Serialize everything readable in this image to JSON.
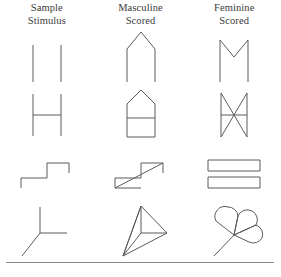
{
  "figure": {
    "columns": [
      {
        "id": "sample-stimulus",
        "line1": "Sample",
        "line2": "Stimulus"
      },
      {
        "id": "masculine-scored",
        "line1": "Masculine",
        "line2": "Scored"
      },
      {
        "id": "feminine-scored",
        "line1": "Feminine",
        "line2": "Scored"
      }
    ],
    "rows": [
      {
        "id": "row-1",
        "stimulus": {
          "name": "two-vertical-lines",
          "label": "two parallel vertical lines"
        },
        "masculine": {
          "name": "peaked-roof",
          "label": "peaked roof with two legs"
        },
        "feminine": {
          "name": "m-shape",
          "label": "M shape with center V notch"
        }
      },
      {
        "id": "row-2",
        "stimulus": {
          "name": "h-shape",
          "label": "H shape"
        },
        "masculine": {
          "name": "house-with-divider",
          "label": "house outline with horizontal divider"
        },
        "feminine": {
          "name": "bowtie-x-frame",
          "label": "X bowtie inside vertical frame with crossbar"
        }
      },
      {
        "id": "row-3",
        "stimulus": {
          "name": "stair-step",
          "label": "stair step line"
        },
        "masculine": {
          "name": "step-with-diagonal",
          "label": "stair step with long diagonal forming triangles"
        },
        "feminine": {
          "name": "two-stacked-rectangles",
          "label": "two stacked horizontal rectangles"
        }
      },
      {
        "id": "row-4",
        "stimulus": {
          "name": "y-junction",
          "label": "three pronged Y junction"
        },
        "masculine": {
          "name": "tetrahedron",
          "label": "three dimensional tetrahedron"
        },
        "feminine": {
          "name": "flower-with-stem",
          "label": "three petal flower with stem"
        }
      }
    ],
    "colors": {
      "ink": "#5b5b5b",
      "text": "#3a3a3a",
      "rule": "#8a8a8a",
      "background": "#ffffff"
    }
  }
}
